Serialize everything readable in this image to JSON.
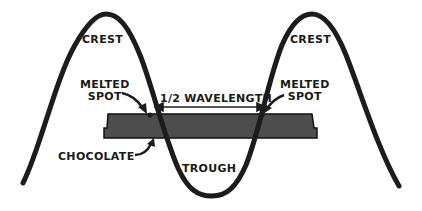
{
  "diagram": {
    "labels": {
      "crest_left": "CREST",
      "crest_right": "CREST",
      "melted_spot_left_line1": "MELTED",
      "melted_spot_left_line2": "SPOT",
      "melted_spot_right_line1": "MELTED",
      "melted_spot_right_line2": "SPOT",
      "half_wavelength": "1/2 WAVELENGTH",
      "chocolate": "CHOCOLATE",
      "trough": "TROUGH"
    },
    "colors": {
      "wave": "#1c1c1c",
      "chocolate_fill": "#4d4d4d",
      "chocolate_stroke": "#111111",
      "text": "#1a1a1a",
      "background": "#ffffff"
    }
  }
}
